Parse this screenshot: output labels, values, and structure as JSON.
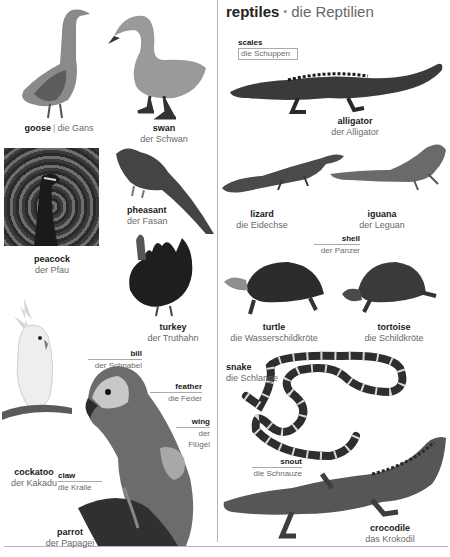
{
  "section": {
    "title_en": "reptiles",
    "separator": "•",
    "title_de": "die Reptilien"
  },
  "birds": [
    {
      "en": "goose",
      "separator": "|",
      "de": "die Gans"
    },
    {
      "en": "swan",
      "de": "der Schwan"
    },
    {
      "en": "pheasant",
      "de": "der Fasan"
    },
    {
      "en": "peacock",
      "de": "der Pfau"
    },
    {
      "en": "turkey",
      "de": "der Truthahn"
    },
    {
      "en": "cockatoo",
      "de": "der Kakadu"
    },
    {
      "en": "parrot",
      "de": "der Papagei"
    }
  ],
  "parrot_parts": [
    {
      "en": "bill",
      "de": "der Schnabel"
    },
    {
      "en": "feather",
      "de": "die Feder"
    },
    {
      "en": "wing",
      "de_line1": "der",
      "de_line2": "Flügel"
    },
    {
      "en": "claw",
      "de": "die Kralle"
    }
  ],
  "reptiles": [
    {
      "en": "alligator",
      "de": "der Alligator"
    },
    {
      "en": "lizard",
      "de": "die Eidechse"
    },
    {
      "en": "iguana",
      "de": "der Leguan"
    },
    {
      "en": "turtle",
      "de": "die Wasserschildkröte"
    },
    {
      "en": "tortoise",
      "de": "die Schildkröte"
    },
    {
      "en": "snake",
      "de": "die Schlange"
    },
    {
      "en": "crocodile",
      "de": "das Krokodil"
    }
  ],
  "reptile_parts": [
    {
      "en": "scales",
      "de": "die Schuppen"
    },
    {
      "en": "shell",
      "de": "der Panzer"
    },
    {
      "en": "snout",
      "de": "die Schnauze"
    }
  ]
}
